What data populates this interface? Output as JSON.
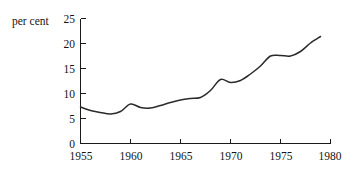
{
  "chart_data": {
    "type": "line",
    "title": "",
    "subtitle": "",
    "xlabel": "",
    "ylabel": "per cent",
    "ylabel_position": "top-left",
    "xlim": [
      1955,
      1980
    ],
    "ylim": [
      0,
      25
    ],
    "grid": false,
    "legend": "none",
    "x_ticks": [
      1955,
      1960,
      1965,
      1970,
      1975,
      1980
    ],
    "x_tick_labels": [
      "1955",
      "1960",
      "1965",
      "1970",
      "1975",
      "1980"
    ],
    "y_ticks": [
      0,
      5,
      10,
      15,
      20,
      25
    ],
    "y_tick_labels": [
      "0",
      "5",
      "10",
      "15",
      "20",
      "25"
    ],
    "series": [
      {
        "name": "per cent",
        "color": "#2a2a2a",
        "x": [
          1955,
          1956,
          1957,
          1958,
          1959,
          1960,
          1961,
          1962,
          1963,
          1964,
          1965,
          1966,
          1967,
          1968,
          1969,
          1970,
          1971,
          1972,
          1973,
          1974,
          1975,
          1976,
          1977,
          1978,
          1979
        ],
        "values": [
          7.3,
          6.6,
          6.2,
          5.9,
          6.4,
          7.9,
          7.2,
          7.1,
          7.6,
          8.2,
          8.7,
          9.0,
          9.2,
          10.6,
          12.8,
          12.2,
          12.6,
          13.9,
          15.5,
          17.5,
          17.6,
          17.5,
          18.4,
          20.1,
          21.4
        ]
      }
    ]
  },
  "axis": {
    "y_axis_name": "y-axis",
    "x_axis_name": "x-axis"
  }
}
